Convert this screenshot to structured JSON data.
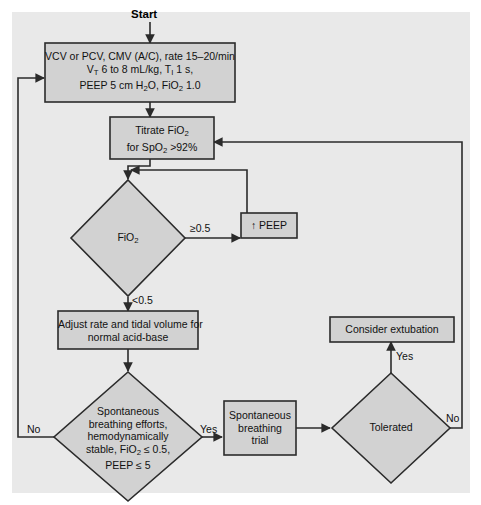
{
  "diagram": {
    "type": "flowchart",
    "background_color": "#ffffff",
    "panel_color": "#e9e9e9",
    "node_fill": "#d2d2d2",
    "node_stroke": "#2b2b2b",
    "text_color": "#111111",
    "start_label": "Start"
  },
  "nodes": {
    "initial_settings": {
      "shape": "process",
      "line1": "VCV or PCV, CMV (A/C), rate 15–20/min",
      "line2_a": "V",
      "line2_sub": "T",
      "line2_b": " 6 to 8 mL/kg, T",
      "line2_sub2": "I",
      "line2_c": " 1 s,",
      "line3_a": "PEEP 5 cm H",
      "line3_sub": "2",
      "line3_b": "O, FiO",
      "line3_sub2": "2",
      "line3_c": " 1.0"
    },
    "titrate": {
      "shape": "process",
      "line1_a": "Titrate FiO",
      "line1_sub": "2",
      "line2_a": "for SpO",
      "line2_sub": "2",
      "line2_b": " >92%"
    },
    "fio2_decision": {
      "shape": "decision",
      "label_a": "FiO",
      "label_sub": "2"
    },
    "increase_peep": {
      "shape": "process",
      "label": "↑ PEEP"
    },
    "adjust": {
      "shape": "process",
      "line1": "Adjust rate and tidal volume for",
      "line2": "normal acid-base"
    },
    "spontaneous_decision": {
      "shape": "decision",
      "line1": "Spontaneous",
      "line2": "breathing efforts,",
      "line3": "hemodynamically",
      "line4_a": "stable, FiO",
      "line4_sub": "2",
      "line4_b": " ≤ 0.5,",
      "line5": "PEEP ≤ 5"
    },
    "sbt": {
      "shape": "process",
      "line1": "Spontaneous",
      "line2": "breathing",
      "line3": "trial"
    },
    "tolerated_decision": {
      "shape": "decision",
      "label": "Tolerated"
    },
    "extubation": {
      "shape": "process",
      "label": "Consider extubation"
    }
  },
  "edge_labels": {
    "fio2_high": "≥0.5",
    "fio2_low": "<0.5",
    "spontaneous_no": "No",
    "spontaneous_yes": "Yes",
    "tolerated_yes": "Yes",
    "tolerated_no": "No"
  }
}
